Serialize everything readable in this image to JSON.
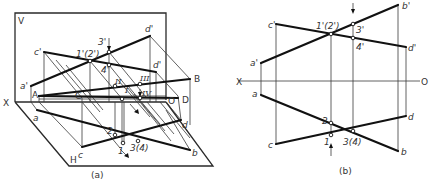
{
  "figure_a": {
    "caption": "(a)",
    "plane_labels": {
      "V": "V",
      "H": "H",
      "X": "X"
    },
    "space_points": {
      "A": "A",
      "B": "B",
      "C": "C",
      "D": "D",
      "O": "O"
    },
    "v_projections": {
      "a": "a'",
      "b": "b'",
      "c": "c'",
      "d": "d'",
      "d2": "d'",
      "p12": "1'(2')",
      "p3": "3'",
      "p4": "4'"
    },
    "h_projections": {
      "a": "a",
      "b": "b",
      "c": "c",
      "d": "d",
      "p1": "1",
      "p2": "2",
      "p34": "3(4)"
    },
    "roman_points": {
      "II": "II",
      "III": "III",
      "IV": "IV",
      "I": "I"
    }
  },
  "figure_b": {
    "caption": "(b)",
    "axis": {
      "X": "X",
      "O": "O"
    },
    "v_projections": {
      "a": "a'",
      "b": "b'",
      "c": "c'",
      "d": "d'",
      "p12": "1'(2')",
      "p3": "3'",
      "p4": "4'"
    },
    "h_projections": {
      "a": "a",
      "b": "b",
      "c": "c",
      "d": "d",
      "p1": "1",
      "p2": "2",
      "p34": "3(4)"
    }
  }
}
